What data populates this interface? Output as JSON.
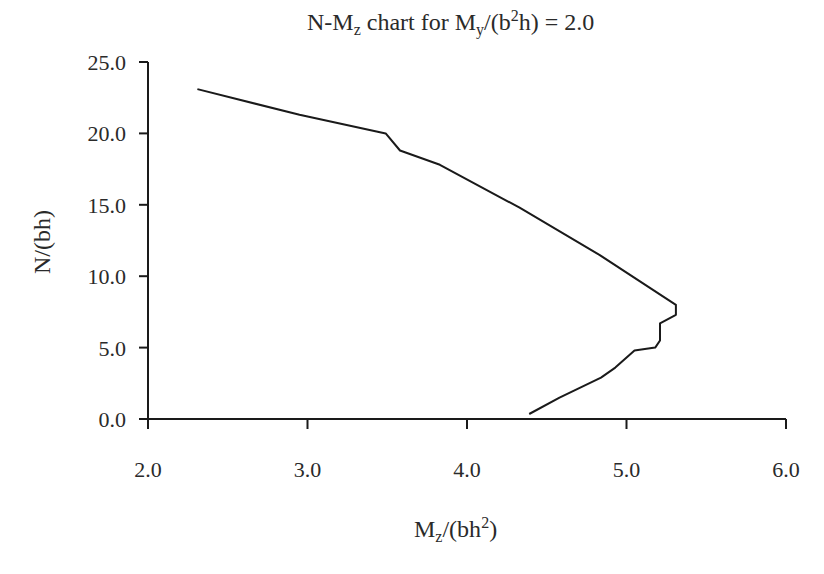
{
  "chart_data": {
    "type": "line",
    "title": "N-Mz chart for My/(b2h) = 2.0",
    "title_parts": {
      "prefix": "N-M",
      "sub1": "z",
      "mid": " chart for M",
      "sub2": "y",
      "mid2": "/(b",
      "sup": "2",
      "suffix": "h) = 2.0"
    },
    "xlabel": "Mz/(bh2)",
    "xlabel_parts": {
      "main": "M",
      "sub": "z",
      "mid": "/(bh",
      "sup": "2",
      "end": ")"
    },
    "ylabel": "N/(bh)",
    "xlim": [
      2.0,
      6.0
    ],
    "ylim": [
      0.0,
      25.0
    ],
    "xticks": [
      "2.0",
      "3.0",
      "4.0",
      "5.0",
      "6.0"
    ],
    "yticks": [
      "0.0",
      "5.0",
      "10.0",
      "15.0",
      "20.0",
      "25.0"
    ],
    "grid": false,
    "legend": null,
    "series": [
      {
        "name": "N-Mz",
        "color": "#1a1a1a",
        "x": [
          2.31,
          2.95,
          3.49,
          3.58,
          3.83,
          4.33,
          4.83,
          5.31,
          5.31,
          5.21,
          5.21,
          5.18,
          5.05,
          4.93,
          4.84,
          4.58,
          4.39
        ],
        "y": [
          23.1,
          21.3,
          20.0,
          18.8,
          17.8,
          14.8,
          11.5,
          8.0,
          7.3,
          6.7,
          5.5,
          5.0,
          4.8,
          3.6,
          2.9,
          1.5,
          0.35
        ]
      }
    ]
  }
}
